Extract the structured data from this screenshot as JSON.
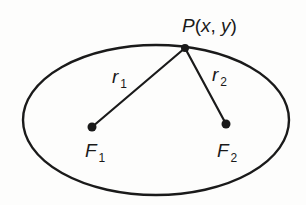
{
  "diagram": {
    "type": "ellipse-foci",
    "colors": {
      "stroke": "#1a1a1a",
      "background": "#fdfdfc"
    },
    "ellipse": {
      "cx": 156,
      "cy": 120,
      "rx": 133,
      "ry": 75
    },
    "point_p": {
      "x": 185,
      "y": 48,
      "label_name": "P",
      "label_open": "(",
      "label_x": "x",
      "label_sep": ", ",
      "label_y": "y",
      "label_close": ")"
    },
    "focus_1": {
      "x": 92,
      "y": 127,
      "label": "F",
      "subscript": "1"
    },
    "focus_2": {
      "x": 226,
      "y": 124,
      "label": "F",
      "subscript": "2"
    },
    "segment_1": {
      "label": "r",
      "subscript": "1"
    },
    "segment_2": {
      "label": "r",
      "subscript": "2"
    }
  }
}
